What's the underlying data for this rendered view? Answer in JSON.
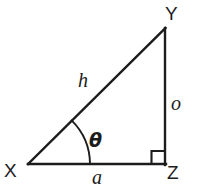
{
  "diagram": {
    "type": "right-triangle",
    "stroke_color": "#1c1c1c",
    "background_color": "#ffffff",
    "stroke_width": 2.2,
    "vertices": [
      {
        "name": "X",
        "label": "X",
        "x": 28,
        "y": 164,
        "role": "angle-vertex"
      },
      {
        "name": "Y",
        "label": "Y",
        "x": 165,
        "y": 28,
        "role": "apex"
      },
      {
        "name": "Z",
        "label": "Z",
        "x": 165,
        "y": 164,
        "role": "right-angle"
      }
    ],
    "sides": [
      {
        "name": "hypotenuse",
        "label": "h",
        "from": "X",
        "to": "Y"
      },
      {
        "name": "opposite",
        "label": "o",
        "from": "Y",
        "to": "Z"
      },
      {
        "name": "adjacent",
        "label": "a",
        "from": "X",
        "to": "Z"
      }
    ],
    "angle": {
      "label": "θ",
      "at_vertex": "X",
      "arc_radius": 62,
      "arc_start_x": 90,
      "arc_start_y": 164,
      "arc_end_x": 72,
      "arc_end_y": 121
    },
    "right_angle_marker": {
      "label": "right-angle-square",
      "at_vertex": "Z",
      "size": 13
    }
  }
}
